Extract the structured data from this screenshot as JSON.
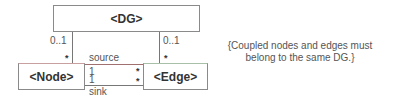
{
  "diagram": {
    "type": "uml-class",
    "classes": {
      "dg": "<DG>",
      "node": "<Node>",
      "edge": "<Edge>"
    },
    "associations": {
      "dg_node": {
        "dg_end": "0..1",
        "node_end": "*"
      },
      "dg_edge": {
        "dg_end": "0..1",
        "edge_end": "*"
      },
      "source": {
        "role": "source",
        "node_end": "1",
        "edge_end": "*"
      },
      "sink": {
        "role": "sink",
        "node_end": "1",
        "edge_end": "*"
      }
    },
    "constraint_note": {
      "line1": "{Coupled nodes and edges must",
      "line2": "belong to the same DG.}"
    }
  }
}
